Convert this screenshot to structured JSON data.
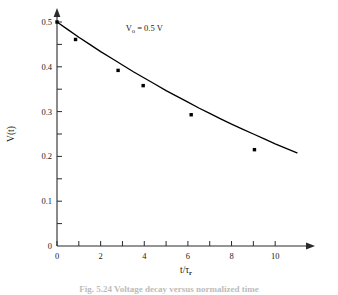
{
  "figure": {
    "caption_partial": "Fig. 5.24   Voltage decay versus normalized time"
  },
  "annotation": {
    "symbol": "V",
    "subscript": "o",
    "value": "= 0.5 V"
  },
  "axes": {
    "xlabel_num": "t/",
    "xlabel_tau": "τ",
    "xlabel_sub": "r",
    "ylabel": "V(t)"
  },
  "chart_data": {
    "type": "line",
    "title": "",
    "subtitle": "",
    "xlabel": "t/τ_r",
    "ylabel": "V(t)",
    "xlim": [
      0,
      11
    ],
    "ylim": [
      0,
      0.5
    ],
    "grid": false,
    "legend": "none",
    "annotations": [
      {
        "text": "V_o = 0.5 V",
        "x": 4.0,
        "y": 0.487
      }
    ],
    "xticks": [
      0,
      1,
      2,
      3,
      4,
      5,
      6,
      7,
      8,
      9,
      10
    ],
    "xtick_labels": [
      "0",
      "",
      "2",
      "",
      "4",
      "",
      "6",
      "",
      "8",
      "",
      "10"
    ],
    "yticks": [
      0,
      0.05,
      0.1,
      0.15,
      0.2,
      0.25,
      0.3,
      0.35,
      0.4,
      0.45,
      0.5
    ],
    "ytick_labels": [
      "0",
      "",
      "0.1",
      "",
      "0.2",
      "",
      "0.3",
      "",
      "0.4",
      "",
      "0.5"
    ],
    "series": [
      {
        "name": "fitted curve",
        "type": "line",
        "x": [
          0,
          0.5,
          1,
          1.5,
          2,
          2.5,
          3,
          3.5,
          4,
          4.5,
          5,
          5.5,
          6,
          6.5,
          7,
          7.5,
          8,
          8.5,
          9,
          9.5,
          10,
          10.5,
          11
        ],
        "y": [
          0.5,
          0.483,
          0.466,
          0.45,
          0.434,
          0.419,
          0.404,
          0.389,
          0.375,
          0.361,
          0.347,
          0.334,
          0.321,
          0.308,
          0.296,
          0.284,
          0.272,
          0.261,
          0.25,
          0.239,
          0.228,
          0.218,
          0.208
        ]
      },
      {
        "name": "measured points",
        "type": "scatter",
        "marker": "filled-square",
        "x": [
          0,
          0.85,
          2.8,
          3.95,
          6.15,
          9.05
        ],
        "y": [
          0.5,
          0.461,
          0.392,
          0.358,
          0.293,
          0.215
        ]
      }
    ]
  }
}
